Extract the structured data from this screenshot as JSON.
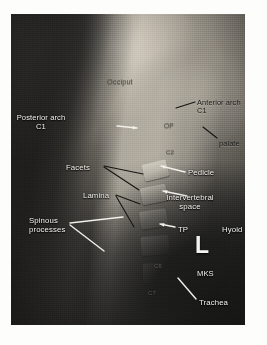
{
  "image": {
    "type": "radiograph",
    "modality": "X-ray",
    "view": "lateral cervical spine",
    "laterality_marker": "L",
    "plate": {
      "left": 11,
      "top": 14,
      "width": 234,
      "height": 311
    },
    "background_color": "#fdfdfb",
    "film_dark_color": "#1d1d1c",
    "film_bright_color": "#e0dace"
  },
  "annotations": {
    "white_labels": [
      {
        "id": "posterior-arch-c1",
        "text": "Posterior arch\nC1",
        "x": 30,
        "y": 100,
        "size": 7.6,
        "align": "center"
      },
      {
        "id": "facets",
        "text": "Facets",
        "x": 55,
        "y": 150,
        "size": 7.8,
        "align": "left"
      },
      {
        "id": "lamina",
        "text": "Lamina",
        "x": 72,
        "y": 178,
        "size": 7.8,
        "align": "left"
      },
      {
        "id": "spinous-processes",
        "text": "Spinous\nprocesses",
        "x": 18,
        "y": 203,
        "size": 7.8,
        "align": "left"
      },
      {
        "id": "pedicle",
        "text": "Pedicle",
        "x": 177,
        "y": 155,
        "size": 7.8,
        "align": "left"
      },
      {
        "id": "intervertebral-space",
        "text": "Intervertebral\nspace",
        "x": 179,
        "y": 180,
        "size": 7.8,
        "align": "center"
      },
      {
        "id": "tp",
        "text": "TP",
        "x": 167,
        "y": 212,
        "size": 7.8,
        "align": "left"
      },
      {
        "id": "hyoid",
        "text": "Hyoid",
        "x": 211,
        "y": 212,
        "size": 7.8,
        "align": "left"
      },
      {
        "id": "mks",
        "text": "MKS",
        "x": 186,
        "y": 256,
        "size": 7.6,
        "align": "left"
      },
      {
        "id": "trachea",
        "text": "Trachea",
        "x": 188,
        "y": 285,
        "size": 7.8,
        "align": "left"
      }
    ],
    "dark_labels": [
      {
        "id": "anterior-arch-c1",
        "text": "Anterior arch\nC1",
        "x": 186,
        "y": 85,
        "size": 7.4,
        "align": "left"
      },
      {
        "id": "palate",
        "text": "palate",
        "x": 208,
        "y": 126,
        "size": 7.4,
        "align": "left"
      }
    ],
    "faint_labels": [
      {
        "id": "occiput",
        "text": "Occiput",
        "x": 96,
        "y": 64,
        "size": 7.4
      },
      {
        "id": "op",
        "text": "OP",
        "x": 153,
        "y": 108,
        "size": 6.6
      },
      {
        "id": "c2",
        "text": "C2",
        "x": 155,
        "y": 135,
        "size": 6.2
      },
      {
        "id": "c6",
        "text": "C6",
        "x": 143,
        "y": 249,
        "size": 6.0
      },
      {
        "id": "c7",
        "text": "C7",
        "x": 137,
        "y": 276,
        "size": 6.0
      }
    ],
    "side_marker": {
      "text": "L",
      "x": 184,
      "y": 218,
      "size": 23
    },
    "white_leader_lines": [
      {
        "id": "lead-posterior-arch",
        "x1": 106,
        "y1": 112,
        "x2": 126,
        "y2": 114,
        "arrow": true
      },
      {
        "id": "lead-pedicle",
        "x1": 174,
        "y1": 158,
        "x2": 150,
        "y2": 152,
        "arrow": true
      },
      {
        "id": "lead-intervertebral",
        "x1": 176,
        "y1": 182,
        "x2": 152,
        "y2": 177,
        "arrow": true
      },
      {
        "id": "lead-tp",
        "x1": 164,
        "y1": 213,
        "x2": 149,
        "y2": 210,
        "arrow": true
      },
      {
        "id": "lead-spinous-upper",
        "x1": 59,
        "y1": 209,
        "x2": 112,
        "y2": 203,
        "arrow": false
      },
      {
        "id": "lead-spinous-lower",
        "x1": 59,
        "y1": 211,
        "x2": 93,
        "y2": 237,
        "arrow": false
      },
      {
        "id": "lead-trachea",
        "x1": 185,
        "y1": 285,
        "x2": 167,
        "y2": 264,
        "arrow": false
      }
    ],
    "dark_leader_lines": [
      {
        "id": "lead-facets-a",
        "x1": 93,
        "y1": 152,
        "x2": 132,
        "y2": 160
      },
      {
        "id": "lead-facets-b",
        "x1": 93,
        "y1": 153,
        "x2": 128,
        "y2": 176
      },
      {
        "id": "lead-lamina-a",
        "x1": 105,
        "y1": 181,
        "x2": 129,
        "y2": 190
      },
      {
        "id": "lead-lamina-b",
        "x1": 105,
        "y1": 182,
        "x2": 123,
        "y2": 213
      },
      {
        "id": "lead-anterior-arch",
        "x1": 184,
        "y1": 88,
        "x2": 165,
        "y2": 94
      },
      {
        "id": "lead-palate",
        "x1": 206,
        "y1": 124,
        "x2": 192,
        "y2": 113
      }
    ]
  },
  "vertebrae": [
    {
      "id": "vert-c3",
      "x": 132,
      "y": 148,
      "w": 25,
      "h": 17,
      "rot": -14
    },
    {
      "id": "vert-c4",
      "x": 130,
      "y": 172,
      "w": 26,
      "h": 17,
      "rot": -11
    },
    {
      "id": "vert-c5",
      "x": 129,
      "y": 196,
      "w": 27,
      "h": 18,
      "rot": -8
    },
    {
      "id": "vert-c6",
      "x": 130,
      "y": 222,
      "w": 28,
      "h": 19,
      "rot": -5
    },
    {
      "id": "vert-c7",
      "x": 132,
      "y": 249,
      "w": 28,
      "h": 20,
      "rot": -2
    }
  ]
}
